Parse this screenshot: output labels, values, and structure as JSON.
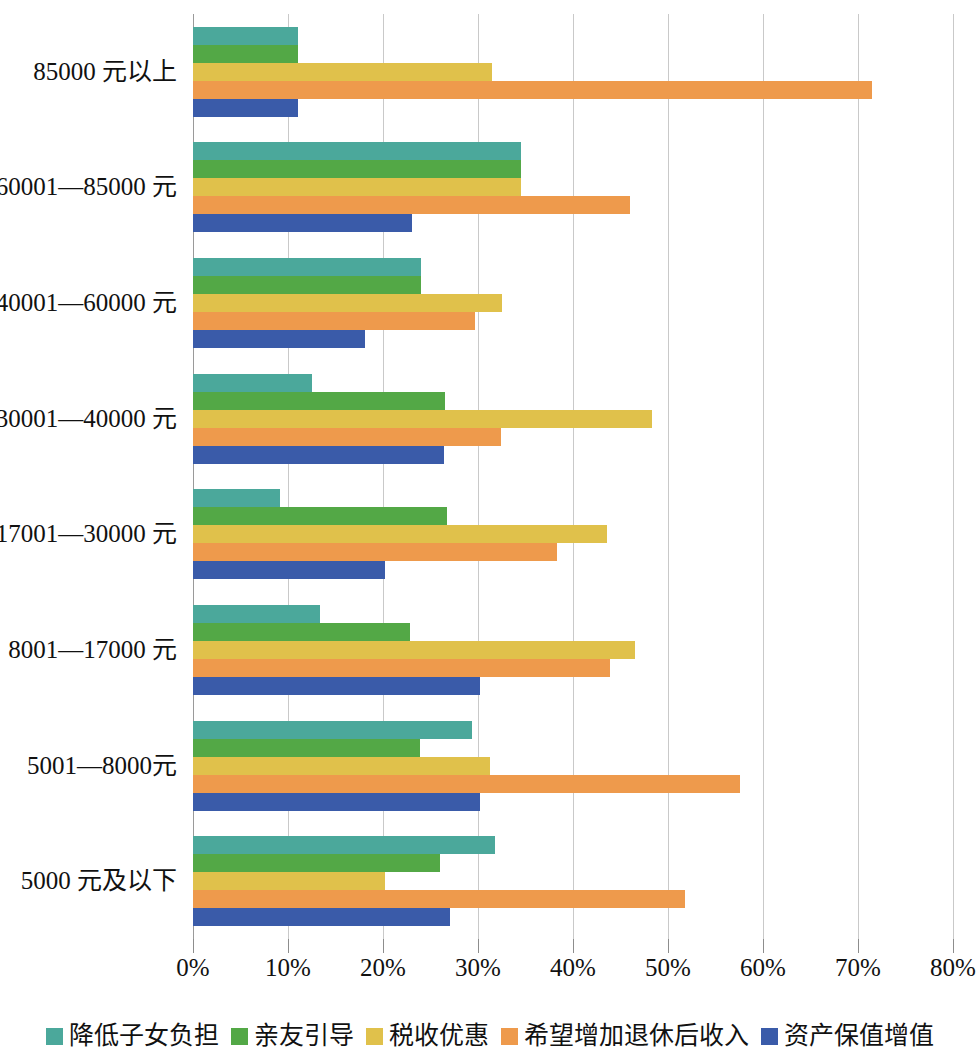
{
  "chart_data": {
    "type": "bar",
    "orientation": "horizontal",
    "title": "",
    "subtitle": "",
    "xlabel": "",
    "ylabel": "",
    "xlim": [
      0,
      80
    ],
    "xunit": "%",
    "grid": true,
    "legend_position": "bottom",
    "xticks": [
      "0%",
      "10%",
      "20%",
      "30%",
      "40%",
      "50%",
      "60%",
      "70%",
      "80%"
    ],
    "xtick_values": [
      0,
      10,
      20,
      30,
      40,
      50,
      60,
      70,
      80
    ],
    "categories": [
      "85000 元以上",
      "60001—85000 元",
      "40001—60000 元",
      "30001—40000 元",
      "17001—30000 元",
      "8001—17000 元",
      "5001—8000元",
      "5000 元及以下"
    ],
    "series": [
      {
        "name": "降低子女负担",
        "color": "#4BA89B",
        "values": [
          11.0,
          34.5,
          24.0,
          12.5,
          9.2,
          13.4,
          29.4,
          31.8
        ]
      },
      {
        "name": "亲友引导",
        "color": "#53A846",
        "values": [
          11.0,
          34.5,
          24.0,
          26.5,
          26.7,
          22.8,
          23.9,
          26.0
        ]
      },
      {
        "name": "税收优惠",
        "color": "#E0C14B",
        "values": [
          31.5,
          34.5,
          32.5,
          48.3,
          43.6,
          46.5,
          31.3,
          20.2
        ]
      },
      {
        "name": "希望增加退休后收入",
        "color": "#EE9A4C",
        "values": [
          71.5,
          46.0,
          29.7,
          32.4,
          38.3,
          43.9,
          57.6,
          51.8
        ]
      },
      {
        "name": "资产保值增值",
        "color": "#3A5BA9",
        "values": [
          11.0,
          23.1,
          18.1,
          26.4,
          20.2,
          30.2,
          30.2,
          27.1
        ]
      }
    ]
  },
  "legend": {
    "items": [
      {
        "label": "降低子女负担",
        "color": "#4BA89B"
      },
      {
        "label": "亲友引导",
        "color": "#53A846"
      },
      {
        "label": "税收优惠",
        "color": "#E0C14B"
      },
      {
        "label": "希望增加退休后收入",
        "color": "#EE9A4C"
      },
      {
        "label": "资产保值增值",
        "color": "#3A5BA9"
      }
    ]
  }
}
